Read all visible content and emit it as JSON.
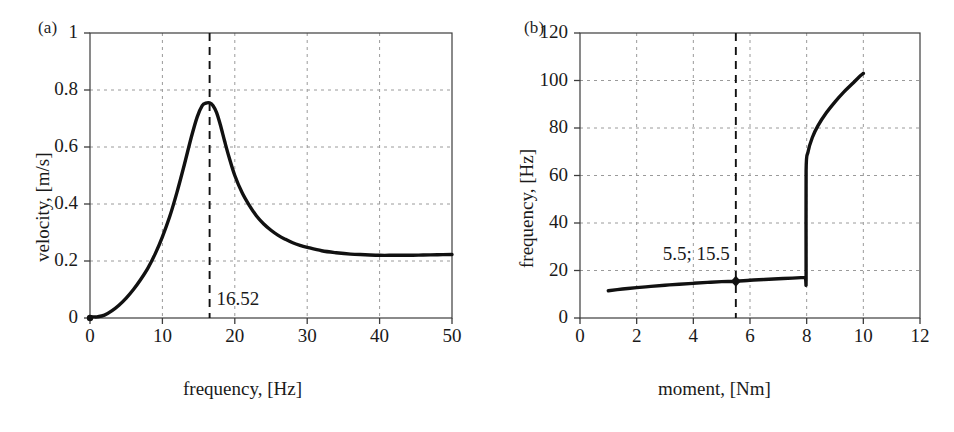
{
  "figure": {
    "background_color": "#ffffff",
    "curve_color": "#111111",
    "grid_color": "#9a9a9a",
    "frame_color": "#3c3c3c"
  },
  "panels": [
    {
      "tag": "(a)",
      "xlabel": "frequency, [Hz]",
      "ylabel": "velocity, [m/s]",
      "xticklabels": [
        "0",
        "10",
        "20",
        "30",
        "40",
        "50"
      ],
      "yticklabels": [
        "0",
        "0.2",
        "0.4",
        "0.6",
        "0.8",
        "1"
      ],
      "annotation": "16.52"
    },
    {
      "tag": "(b)",
      "xlabel": "moment, [Nm]",
      "ylabel": "frequency, [Hz]",
      "xticklabels": [
        "0",
        "2",
        "4",
        "6",
        "8",
        "10",
        "12"
      ],
      "yticklabels": [
        "0",
        "20",
        "40",
        "60",
        "80",
        "100",
        "120"
      ],
      "annotation": "5.5; 15.5"
    }
  ],
  "chart_data": [
    {
      "type": "line",
      "title": "(a)",
      "xlabel": "frequency, [Hz]",
      "ylabel": "velocity, [m/s]",
      "xlim": [
        0,
        50
      ],
      "ylim": [
        0,
        1
      ],
      "xticks": [
        0,
        10,
        20,
        30,
        40,
        50
      ],
      "yticks": [
        0,
        0.2,
        0.4,
        0.6,
        0.8,
        1
      ],
      "grid": true,
      "legend": "none",
      "annotations": [
        {
          "text": "16.52",
          "x": 16.52,
          "y": 0.06,
          "marker": "dashed-vertical-line",
          "note": "resonance peak frequency"
        }
      ],
      "markers": [
        {
          "x": 0,
          "y": 0,
          "shape": "dot"
        }
      ],
      "series": [
        {
          "name": "velocity response",
          "x": [
            0,
            0.5,
            1,
            2,
            3,
            4,
            5,
            6,
            7,
            8,
            9,
            10,
            11,
            12,
            13,
            14,
            14.8,
            15.5,
            16,
            16.52,
            17,
            17.5,
            18,
            18.6,
            19.2,
            20,
            21,
            22,
            23,
            24,
            25,
            26,
            27,
            28,
            29,
            30,
            32,
            34,
            36,
            38,
            40,
            42,
            44,
            46,
            48,
            50
          ],
          "y": [
            0.005,
            0.004,
            0.004,
            0.01,
            0.025,
            0.045,
            0.07,
            0.1,
            0.135,
            0.175,
            0.225,
            0.285,
            0.355,
            0.44,
            0.535,
            0.635,
            0.705,
            0.745,
            0.754,
            0.755,
            0.745,
            0.72,
            0.678,
            0.62,
            0.565,
            0.5,
            0.44,
            0.395,
            0.358,
            0.33,
            0.308,
            0.29,
            0.276,
            0.264,
            0.255,
            0.248,
            0.236,
            0.229,
            0.224,
            0.222,
            0.22,
            0.22,
            0.22,
            0.221,
            0.222,
            0.223
          ]
        }
      ]
    },
    {
      "type": "line",
      "title": "(b)",
      "xlabel": "moment, [Nm]",
      "ylabel": "frequency, [Hz]",
      "xlim": [
        0,
        12
      ],
      "ylim": [
        0,
        120
      ],
      "xticks": [
        0,
        2,
        4,
        6,
        8,
        10,
        12
      ],
      "yticks": [
        0,
        20,
        40,
        60,
        80,
        100,
        120
      ],
      "grid": true,
      "legend": "none",
      "annotations": [
        {
          "text": "5.5; 15.5",
          "x": 5.5,
          "y": 26,
          "marker": "dashed-vertical-line",
          "note": "operating point moment 5.5 Nm, frequency 15.5 Hz"
        }
      ],
      "markers": [
        {
          "x": 5.5,
          "y": 15.5,
          "shape": "diamond"
        }
      ],
      "series": [
        {
          "name": "frequency vs moment",
          "x": [
            1,
            1.5,
            2,
            2.5,
            3,
            3.5,
            4,
            4.5,
            5,
            5.5,
            6,
            6.5,
            7,
            7.5,
            7.8,
            7.95,
            7.98,
            7.98,
            8.05,
            8.2,
            8.4,
            8.7,
            9,
            9.3,
            9.6,
            9.85,
            10
          ],
          "y": [
            11.5,
            12.2,
            12.8,
            13.3,
            13.8,
            14.2,
            14.6,
            15,
            15.3,
            15.5,
            15.9,
            16.2,
            16.5,
            16.8,
            17,
            17.1,
            17.1,
            62,
            70,
            76,
            81,
            86.5,
            91,
            95,
            98.5,
            101.5,
            103
          ]
        }
      ]
    }
  ]
}
